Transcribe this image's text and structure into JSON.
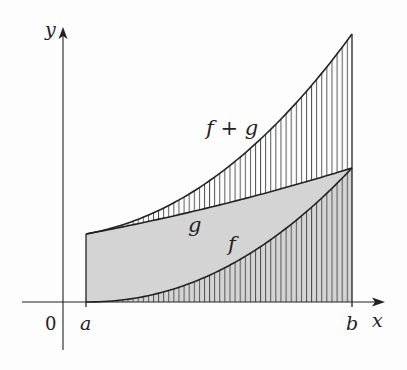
{
  "diagram": {
    "axes": {
      "x_label": "x",
      "y_label": "y",
      "origin_label": "0"
    },
    "interval": {
      "left_label": "a",
      "right_label": "b"
    },
    "curves": [
      {
        "id": "f",
        "label": "f",
        "shape": "increasing convex curve from (a,0) to (b, g(b))"
      },
      {
        "id": "g",
        "label": "g",
        "shape": "slightly increasing line-like curve"
      },
      {
        "id": "f_plus_g",
        "label": "f + g",
        "shape": "increasing convex curve, top boundary"
      }
    ],
    "regions": [
      {
        "id": "under_f",
        "fill": "gray with vertical hatching"
      },
      {
        "id": "between_f_and_g",
        "fill": "gray"
      },
      {
        "id": "between_g_and_f_plus_g",
        "fill": "white with vertical hatching"
      }
    ],
    "colors": {
      "background": "#fdfdfd",
      "gray_fill": "#d4d4d4",
      "line": "#222222",
      "hatch": "#444444"
    }
  }
}
